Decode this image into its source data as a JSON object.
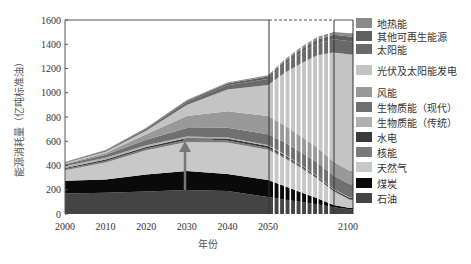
{
  "chart_data": {
    "type": "area",
    "title": "",
    "xlabel": "年份",
    "ylabel": "能源消耗量（亿吨标准油）",
    "ylim": [
      0,
      1600
    ],
    "yticks": [
      0,
      200,
      400,
      600,
      800,
      1000,
      1200,
      1400,
      1600
    ],
    "xticks": [
      2000,
      2010,
      2020,
      2030,
      2040,
      2050,
      2100
    ],
    "x": [
      2000,
      2010,
      2020,
      2030,
      2040,
      2050,
      2060,
      2070,
      2080,
      2090,
      2100
    ],
    "grid": false,
    "legend_position": "right",
    "annotations": [
      "upward arrow at ~2030 from ~210 to ~590",
      "vertical line at 2050",
      "vertical line near 2090",
      "dashed top border between 2050 and ~2090",
      "white vertical stripes between 2050 and ~2090"
    ],
    "series": [
      {
        "name": "石油",
        "color": "#444444",
        "values": [
          170,
          175,
          185,
          198,
          190,
          140,
          120,
          100,
          80,
          55,
          40
        ]
      },
      {
        "name": "煤炭",
        "color": "#0a0a0a",
        "values": [
          105,
          110,
          140,
          157,
          140,
          140,
          110,
          80,
          50,
          20,
          10
        ]
      },
      {
        "name": "天然气",
        "color": "#c8c8c8",
        "values": [
          85,
          140,
          200,
          240,
          260,
          250,
          230,
          200,
          160,
          110,
          65
        ]
      },
      {
        "name": "核能",
        "color": "#7a7a7a",
        "values": [
          10,
          12,
          14,
          16,
          16,
          14,
          12,
          10,
          8,
          6,
          5
        ]
      },
      {
        "name": "水电",
        "color": "#3a3a3a",
        "values": [
          10,
          12,
          14,
          16,
          16,
          16,
          14,
          12,
          12,
          12,
          12
        ]
      },
      {
        "name": "生物质能（传统）",
        "color": "#b0b0b0",
        "values": [
          15,
          15,
          14,
          12,
          10,
          8,
          6,
          5,
          4,
          3,
          3
        ]
      },
      {
        "name": "生物质能（现代）",
        "color": "#707070",
        "values": [
          15,
          25,
          45,
          70,
          80,
          90,
          100,
          105,
          110,
          110,
          110
        ]
      },
      {
        "name": "风能",
        "color": "#999999",
        "values": [
          5,
          15,
          45,
          100,
          135,
          150,
          140,
          130,
          125,
          115,
          110
        ]
      },
      {
        "name": "光伏及太阳能发电",
        "color": "#c4c4c4",
        "values": [
          5,
          10,
          30,
          90,
          180,
          255,
          430,
          600,
          760,
          900,
          960
        ]
      },
      {
        "name": "太阳能",
        "color": "#6a6a6a",
        "values": [
          5,
          8,
          15,
          25,
          35,
          50,
          70,
          85,
          95,
          110,
          110
        ]
      },
      {
        "name": "其他可再生能源",
        "color": "#606060",
        "values": [
          3,
          4,
          6,
          10,
          14,
          20,
          25,
          30,
          35,
          38,
          40
        ]
      },
      {
        "name": "地热能",
        "color": "#8a8a8a",
        "values": [
          2,
          3,
          4,
          6,
          8,
          12,
          15,
          18,
          20,
          22,
          25
        ]
      }
    ]
  },
  "axes": {
    "ylabel": "能源消耗量（亿吨标准油）",
    "xlabel": "年份",
    "yticks": [
      "0",
      "200",
      "400",
      "600",
      "800",
      "1000",
      "1200",
      "1400",
      "1600"
    ],
    "xticks": [
      "2000",
      "2010",
      "2020",
      "2030",
      "2040",
      "2050",
      "2100"
    ]
  },
  "legend": [
    {
      "label": "地热能",
      "color": "#8a8a8a"
    },
    {
      "label": "其他可再生能源",
      "color": "#606060"
    },
    {
      "label": "太阳能",
      "color": "#6a6a6a"
    },
    {
      "label": "光伏及太阳能发电",
      "color": "#c4c4c4"
    },
    {
      "label": "风能",
      "color": "#999999"
    },
    {
      "label": "生物质能（现代）",
      "color": "#707070"
    },
    {
      "label": "生物质能（传统）",
      "color": "#b0b0b0"
    },
    {
      "label": "水电",
      "color": "#3a3a3a"
    },
    {
      "label": "核能",
      "color": "#7a7a7a"
    },
    {
      "label": "天然气",
      "color": "#c8c8c8"
    },
    {
      "label": "煤炭",
      "color": "#0a0a0a"
    },
    {
      "label": "石油",
      "color": "#444444"
    }
  ]
}
